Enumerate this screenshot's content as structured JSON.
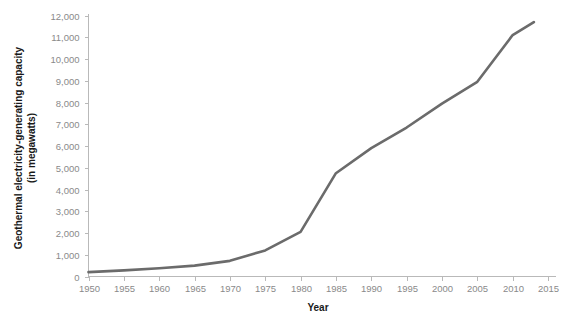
{
  "chart_data": {
    "type": "line",
    "title": "",
    "subtitle": "",
    "xlabel": "Year",
    "ylabel": "Geothermal electricity-generating capacity\n(in megawatts)",
    "ylabel_line1": "Geothermal electricity-generating capacity",
    "ylabel_line2": "(in megawatts)",
    "xlim": [
      1950,
      2015
    ],
    "ylim": [
      0,
      12000
    ],
    "grid": false,
    "legend": "none",
    "line_color": "#6b6b6b",
    "axis_color": "#b9b9b9",
    "tick_label_color": "#8a8a8a",
    "x_ticks": [
      1950,
      1955,
      1960,
      1965,
      1970,
      1975,
      1980,
      1985,
      1990,
      1995,
      2000,
      2005,
      2010,
      2015
    ],
    "x_tick_labels": [
      "1950",
      "1955",
      "1960",
      "1965",
      "1970",
      "1975",
      "1980",
      "1985",
      "1990",
      "1995",
      "2000",
      "2005",
      "2010",
      "2015"
    ],
    "y_ticks": [
      0,
      1000,
      2000,
      3000,
      4000,
      5000,
      6000,
      7000,
      8000,
      9000,
      10000,
      11000,
      12000
    ],
    "y_tick_labels": [
      "0",
      "1,000",
      "2,000",
      "3,000",
      "4,000",
      "5,000",
      "6,000",
      "7,000",
      "8,000",
      "9,000",
      "10,000",
      "11,000",
      "12,000"
    ],
    "series": [
      {
        "name": "Geothermal electricity-generating capacity",
        "x": [
          1950,
          1955,
          1960,
          1965,
          1970,
          1975,
          1980,
          1985,
          1990,
          1995,
          2000,
          2005,
          2010,
          2013
        ],
        "values": [
          200,
          280,
          380,
          500,
          720,
          1200,
          2050,
          4750,
          5900,
          6850,
          7950,
          8950,
          11100,
          11700
        ]
      }
    ]
  }
}
